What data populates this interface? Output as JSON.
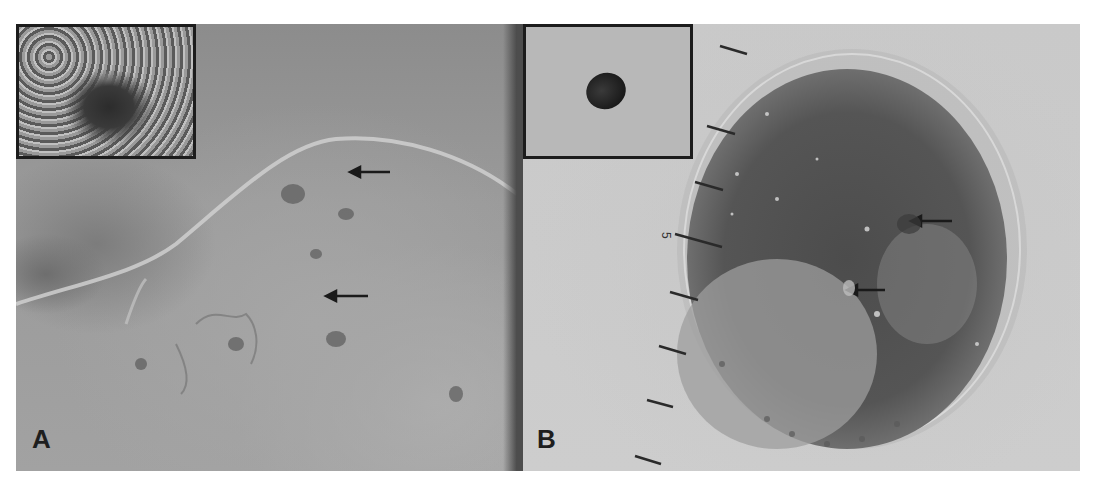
{
  "figure": {
    "panels": [
      {
        "id": "A",
        "label": "A",
        "description": "Dermoscopic image, grayscale, with inset of overview lesion",
        "arrows": 2,
        "inset": "clinical overview of lesion (dark area centered)"
      },
      {
        "id": "B",
        "label": "B",
        "description": "Dermoscopic image of oval pigmented lesion with ruler scale marks",
        "arrows": 2,
        "ruler_label": "5",
        "ruler_ticks": 8,
        "inset": "clinical overview showing small dark papule"
      }
    ],
    "colors": {
      "background": "#ffffff",
      "inset_border": "#1c1c1c",
      "label": "#1e1e1e"
    }
  }
}
